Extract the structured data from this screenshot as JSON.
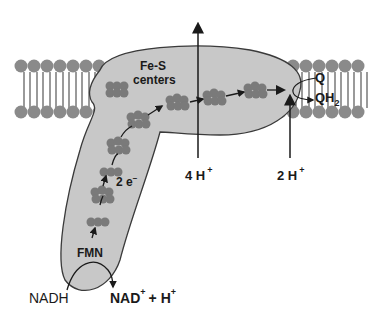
{
  "figure": {
    "labels": {
      "fes_line1": "Fe-S",
      "fes_line2": "centers",
      "q": "Q",
      "qh2_base": "QH",
      "qh2_sub": "2",
      "electrons": "2 e",
      "electrons_sup": "−",
      "fmn": "FMN",
      "nadh": "NADH",
      "nad_base": "NAD",
      "nad_sup": "+",
      "nad_plus_h": "+ H",
      "nad_plus_h_sup": "+",
      "four_h": "4 H",
      "four_h_sup": "+",
      "two_h": "2 H",
      "two_h_sup": "+"
    },
    "colors": {
      "protein": "#c8c8c8",
      "protein_stroke": "#3a3a3a",
      "lipid_head": "#8a8a8a",
      "lipid_tail": "#9a9a9a",
      "cluster": "#7a7a7a",
      "arrow": "#1a1a1a"
    }
  }
}
